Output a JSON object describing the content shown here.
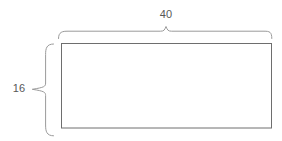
{
  "diagram": {
    "type": "geometry-figure",
    "shape": "rectangle",
    "background_color": "#ffffff",
    "shape_stroke_color": "#6e6e6e",
    "brace_stroke_color": "#9a9a9a",
    "label_color": "#585858",
    "width_label": "40",
    "height_label": "16",
    "width_annotation_name": "width-dimension",
    "height_annotation_name": "height-dimension",
    "icons": {
      "top_brace": "curly-brace-horizontal-icon",
      "left_brace": "curly-brace-vertical-icon",
      "rectangle": "rectangle-outline-icon"
    }
  }
}
